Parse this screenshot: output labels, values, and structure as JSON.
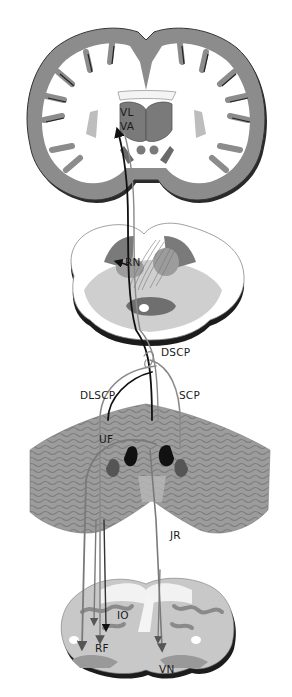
{
  "diagram": {
    "type": "neuroanatomy-pathway",
    "sections": [
      {
        "id": "cerebrum",
        "description": "coronal section of cerebral hemispheres with thalamus"
      },
      {
        "id": "midbrain",
        "description": "transverse section of midbrain"
      },
      {
        "id": "cerebellum",
        "description": "posterior view of cerebellum with deep nuclei"
      },
      {
        "id": "medulla",
        "description": "transverse section of medulla"
      }
    ],
    "labels": {
      "vl": "VL",
      "va": "VA",
      "rn": "RN",
      "dscp": "DSCP",
      "dlscp": "DLSCP",
      "scp": "SCP",
      "uf": "UF",
      "jr": "JR",
      "io": "IO",
      "rf": "RF",
      "vn": "VN"
    },
    "colors": {
      "cortex": "#8c8c8c",
      "cortex_shadow": "#2a2a2a",
      "white_matter": "#ffffff",
      "midbrain_gray": "#c8c8c8",
      "midbrain_dark": "#7a7a7a",
      "cerebellum": "#9a9a9a",
      "fiber_dark": "#111111",
      "fiber_gray": "#8a8a8a"
    }
  }
}
